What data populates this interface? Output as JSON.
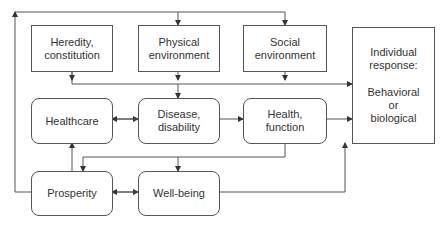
{
  "diagram": {
    "nodes": [
      {
        "id": "heredity",
        "lines": [
          "Heredity,",
          "constitution"
        ],
        "shape": "rect"
      },
      {
        "id": "physical",
        "lines": [
          "Physical",
          "environment"
        ],
        "shape": "rect"
      },
      {
        "id": "social",
        "lines": [
          "Social",
          "environment"
        ],
        "shape": "rect"
      },
      {
        "id": "response",
        "lines": [
          "Individual",
          "response:",
          "Behavioral",
          "or",
          "biological"
        ],
        "shape": "rect"
      },
      {
        "id": "healthcare",
        "lines": [
          "Healthcare"
        ],
        "shape": "rounded"
      },
      {
        "id": "disease",
        "lines": [
          "Disease,",
          "disability"
        ],
        "shape": "rounded"
      },
      {
        "id": "health",
        "lines": [
          "Health,",
          "function"
        ],
        "shape": "rounded"
      },
      {
        "id": "prosperity",
        "lines": [
          "Prosperity"
        ],
        "shape": "rounded"
      },
      {
        "id": "wellbeing",
        "lines": [
          "Well-being"
        ],
        "shape": "rounded"
      }
    ],
    "edges": [
      {
        "from": "prosperity",
        "to": "physical",
        "via": "feedback loop top"
      },
      {
        "from": "prosperity",
        "to": "social",
        "via": "feedback loop top"
      },
      {
        "from": "heredity",
        "to": "response"
      },
      {
        "from": "physical",
        "to": "response"
      },
      {
        "from": "social",
        "to": "response"
      },
      {
        "from": "physical",
        "to": "disease"
      },
      {
        "from": "healthcare",
        "to": "disease",
        "bidirectional": true
      },
      {
        "from": "disease",
        "to": "health"
      },
      {
        "from": "health",
        "to": "response"
      },
      {
        "from": "health",
        "to": "prosperity"
      },
      {
        "from": "health",
        "to": "wellbeing"
      },
      {
        "from": "prosperity",
        "to": "healthcare"
      },
      {
        "from": "prosperity",
        "to": "wellbeing",
        "bidirectional": true
      },
      {
        "from": "wellbeing",
        "to": "response"
      }
    ],
    "colors": {
      "line": "#555555",
      "text": "#333333",
      "background": "#ffffff"
    }
  }
}
